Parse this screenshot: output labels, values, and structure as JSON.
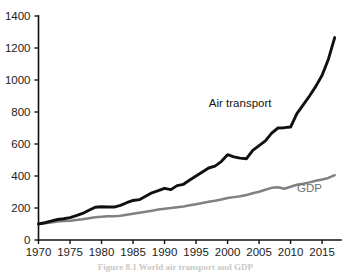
{
  "figure": {
    "caption": "Figure 8.1  World air transport and GDP"
  },
  "chart_data": {
    "type": "line",
    "title": "",
    "subtitle": "",
    "xlabel": "",
    "ylabel": "",
    "xlim": [
      1970,
      2018
    ],
    "ylim": [
      0,
      1400
    ],
    "grid": false,
    "legend_position": "inline-annotation",
    "x_ticks": [
      "1970",
      "1975",
      "1980",
      "1985",
      "1990",
      "1995",
      "2000",
      "2005",
      "2010",
      "2015"
    ],
    "x_tick_values": [
      1970,
      1975,
      1980,
      1985,
      1990,
      1995,
      2000,
      2005,
      2010,
      2015
    ],
    "y_ticks": [
      "0",
      "200",
      "400",
      "600",
      "800",
      "1000",
      "1200",
      "1400"
    ],
    "y_tick_values": [
      0,
      200,
      400,
      600,
      800,
      1000,
      1200,
      1400
    ],
    "x": [
      1970,
      1971,
      1972,
      1973,
      1974,
      1975,
      1976,
      1977,
      1978,
      1979,
      1980,
      1981,
      1982,
      1983,
      1984,
      1985,
      1986,
      1987,
      1988,
      1989,
      1990,
      1991,
      1992,
      1993,
      1994,
      1995,
      1996,
      1997,
      1998,
      1999,
      2000,
      2001,
      2002,
      2003,
      2004,
      2005,
      2006,
      2007,
      2008,
      2009,
      2010,
      2011,
      2012,
      2013,
      2014,
      2015,
      2016,
      2017
    ],
    "series": [
      {
        "name": "Air transport",
        "color": "#101010",
        "label_x": 2002,
        "label_y": 830,
        "values": [
          100,
          108,
          118,
          128,
          133,
          140,
          152,
          166,
          186,
          205,
          208,
          206,
          206,
          216,
          233,
          247,
          252,
          273,
          295,
          308,
          323,
          315,
          340,
          348,
          375,
          400,
          425,
          450,
          462,
          490,
          533,
          520,
          512,
          508,
          560,
          590,
          620,
          668,
          700,
          702,
          706,
          790,
          845,
          900,
          960,
          1030,
          1130,
          1265
        ]
      },
      {
        "name": "GDP",
        "color": "#818181",
        "label_x": 2013,
        "label_y": 300,
        "values": [
          100,
          104,
          109,
          115,
          118,
          120,
          125,
          130,
          136,
          142,
          145,
          148,
          149,
          152,
          158,
          164,
          170,
          176,
          183,
          190,
          196,
          200,
          205,
          210,
          217,
          224,
          231,
          239,
          245,
          253,
          263,
          268,
          273,
          281,
          292,
          302,
          314,
          326,
          330,
          320,
          333,
          345,
          352,
          360,
          370,
          378,
          388,
          405
        ]
      }
    ]
  }
}
